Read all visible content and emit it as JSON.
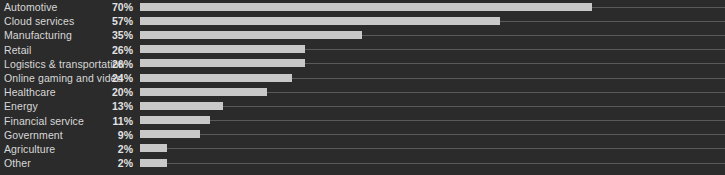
{
  "chart_data": {
    "type": "bar",
    "orientation": "horizontal",
    "title": "",
    "subtitle": "",
    "xlabel": "",
    "ylabel": "",
    "grid": false,
    "legend": null,
    "legend_position": "none",
    "xlim": [
      0,
      100
    ],
    "value_suffix": "%",
    "categories": [
      "Automotive",
      "Cloud services",
      "Manufacturing",
      "Retail",
      "Logistics & transportation",
      "Online gaming and video",
      "Healthcare",
      "Energy",
      "Financial service",
      "Government",
      "Agriculture",
      "Other"
    ],
    "values": [
      70,
      57,
      35,
      26,
      26,
      24,
      20,
      13,
      11,
      9,
      2,
      2
    ],
    "value_labels": [
      "70%",
      "57%",
      "35%",
      "26%",
      "26%",
      "24%",
      "20%",
      "13%",
      "11%",
      "9%",
      "2%",
      "2%"
    ],
    "bar_pixel_widths": [
      452,
      360,
      222,
      165,
      165,
      152,
      127,
      83,
      70,
      60,
      27,
      27
    ],
    "colors": {
      "background": "#2b2b2b",
      "bar": "#c8c8c8",
      "track": "#5a5a5a",
      "label_text": "#d8d8d8",
      "value_text": "#e2e2e2"
    }
  },
  "footnote": {
    "text": ""
  }
}
